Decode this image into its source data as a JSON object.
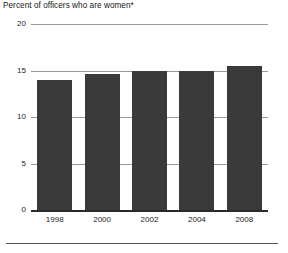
{
  "chart_data": {
    "type": "bar",
    "title": "Percent of officers who are women*",
    "xlabel": "",
    "ylabel": "",
    "categories": [
      "1998",
      "2000",
      "2002",
      "2004",
      "2008"
    ],
    "values": [
      14.0,
      14.6,
      15.0,
      15.0,
      15.5
    ],
    "ylim": [
      0,
      20
    ],
    "yticks": [
      0,
      5,
      10,
      15,
      20
    ],
    "ytick_labels": [
      "0",
      "5",
      "10",
      "15",
      "20"
    ],
    "grid": true,
    "legend": null,
    "bar_color": "#3a3a3a",
    "gridline_color": "#9a9a9a",
    "axis_color": "#2a2a2a",
    "footnote_marker": "*"
  },
  "figure": {
    "background": "#ffffff",
    "bottom_rule_color": "#555555"
  }
}
